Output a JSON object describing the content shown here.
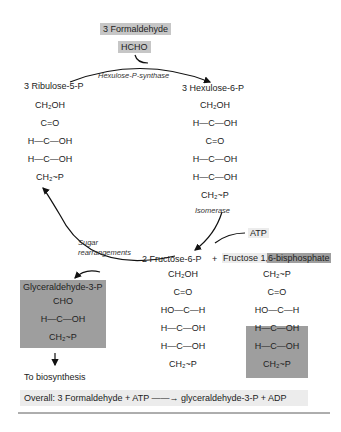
{
  "title_input": {
    "label": "3 Formaldehyde",
    "formula": "HCHO"
  },
  "enzymes": {
    "synthase": "Hexulose-P-synthase",
    "isomerase": "Isomerase",
    "rearrange_1": "Sugar",
    "rearrange_2": "rearrangements"
  },
  "compounds": {
    "ribulose": {
      "label": "3 Ribulose-5-P",
      "rows": [
        "CH₂OH",
        "C=O",
        "H—C—OH",
        "H—C—OH",
        "CH₂~P"
      ]
    },
    "hexulose": {
      "label": "3 Hexulose-6-P",
      "rows": [
        "CH₂OH",
        "H—C—OH",
        "C=O",
        "H—C—OH",
        "H—C—OH",
        "CH₂~P"
      ]
    },
    "fructose6p": {
      "label": "2 Fructose-6-P",
      "rows": [
        "CH₂OH",
        "C=O",
        "HO—C—H",
        "H—C—OH",
        "H—C—OH",
        "CH₂~P"
      ]
    },
    "plus": "+",
    "fbp": {
      "label_a": "Fructose 1,",
      "label_b": "6-bisphosphate",
      "rows": [
        "CH₂~P",
        "C=O",
        "HO—C—H",
        "H—C—OH",
        "H—C—OH",
        "CH₂~P"
      ]
    },
    "g3p": {
      "label": "Glyceraldehyde-3-P",
      "rows": [
        "CHO",
        "H—C—OH",
        "CH₂~P"
      ]
    }
  },
  "atp": "ATP",
  "to_biosynthesis": "To biosynthesis",
  "overall": "Overall:  3 Formaldehyde  +  ATP ——→  glyceraldehyde-3-P  +  ADP"
}
